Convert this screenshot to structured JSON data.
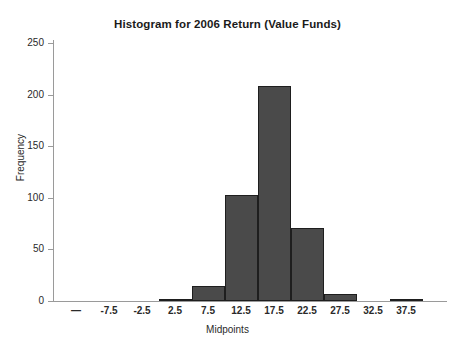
{
  "chart_data": {
    "type": "bar",
    "title": "Histogram for 2006 Return (Value Funds)",
    "xlabel": "Midpoints",
    "ylabel": "Frequency",
    "categories": [
      "—",
      "-7.5",
      "-2.5",
      "2.5",
      "7.5",
      "12.5",
      "17.5",
      "22.5",
      "27.5",
      "32.5",
      "37.5"
    ],
    "values": [
      0,
      0,
      0,
      2,
      15,
      103,
      208,
      71,
      7,
      0,
      1
    ],
    "xlim": [
      "—",
      "37.5"
    ],
    "ylim": [
      0,
      250
    ],
    "yticks": [
      0,
      50,
      100,
      150,
      200,
      250
    ],
    "ytick_labels": [
      "0",
      "50",
      "100",
      "150",
      "200",
      "250"
    ],
    "grid": false,
    "legend": false,
    "bar_color": "#4a4a4a",
    "bar_edge_color": "#1e1e1e",
    "background_color": "#ffffff",
    "axis_color": "#9a9a9a"
  }
}
